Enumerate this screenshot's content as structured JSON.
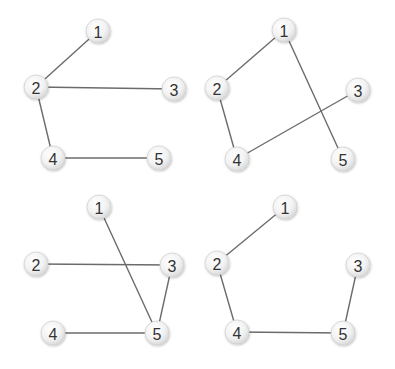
{
  "diagram": {
    "type": "graph-set",
    "panels": [
      {
        "id": "top-left",
        "nodes": [
          "1",
          "2",
          "3",
          "4",
          "5"
        ],
        "edges": [
          [
            "1",
            "2"
          ],
          [
            "2",
            "3"
          ],
          [
            "2",
            "4"
          ],
          [
            "4",
            "5"
          ]
        ]
      },
      {
        "id": "top-right",
        "nodes": [
          "1",
          "2",
          "3",
          "4",
          "5"
        ],
        "edges": [
          [
            "1",
            "2"
          ],
          [
            "1",
            "5"
          ],
          [
            "2",
            "4"
          ],
          [
            "3",
            "4"
          ]
        ]
      },
      {
        "id": "bottom-left",
        "nodes": [
          "1",
          "2",
          "3",
          "4",
          "5"
        ],
        "edges": [
          [
            "1",
            "5"
          ],
          [
            "2",
            "3"
          ],
          [
            "3",
            "5"
          ],
          [
            "4",
            "5"
          ]
        ]
      },
      {
        "id": "bottom-right",
        "nodes": [
          "1",
          "2",
          "3",
          "4",
          "5"
        ],
        "edges": [
          [
            "1",
            "2"
          ],
          [
            "2",
            "4"
          ],
          [
            "4",
            "5"
          ],
          [
            "3",
            "5"
          ]
        ]
      }
    ]
  }
}
